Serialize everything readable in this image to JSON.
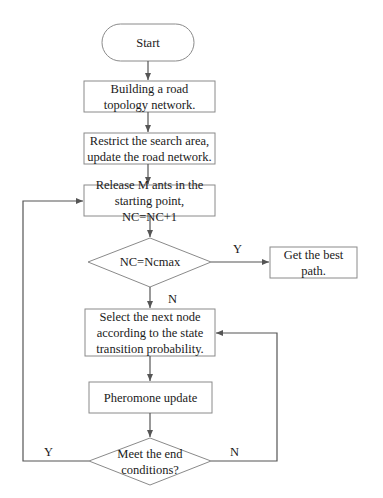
{
  "flowchart": {
    "nodes": {
      "start": {
        "label": "Start",
        "shape": "terminator"
      },
      "build": {
        "label": "Building a road topology network.",
        "shape": "process"
      },
      "restrict": {
        "label": "Restrict the search area, update the road network.",
        "shape": "process"
      },
      "release": {
        "label": "Release M ants in the starting point, NC=NC+1",
        "shape": "process"
      },
      "check_nc": {
        "label": "NC=Ncmax",
        "shape": "decision"
      },
      "best_path": {
        "label": "Get the best path.",
        "shape": "process"
      },
      "select": {
        "label": "Select the next node according to the state transition probability.",
        "shape": "process"
      },
      "pheromone": {
        "label": "Pheromone update",
        "shape": "process"
      },
      "end_cond": {
        "label": "Meet the end conditions?",
        "shape": "decision"
      }
    },
    "edge_labels": {
      "check_nc_yes": "Y",
      "check_nc_no": "N",
      "end_cond_yes": "Y",
      "end_cond_no": "N"
    },
    "colors": {
      "stroke": "#8a8a8a",
      "arrow": "#555555",
      "text": "#1a1a1a"
    }
  }
}
